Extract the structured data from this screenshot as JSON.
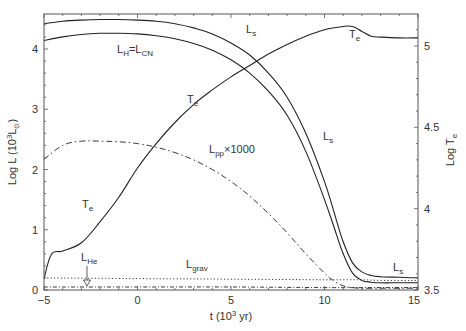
{
  "chart_data": {
    "type": "line",
    "title": "",
    "xlabel": "t (10^3 yr)",
    "ylabel_left": "Log L (10^3 L☉)",
    "ylabel_right": "Log T_e",
    "xlim": [
      -5,
      15
    ],
    "ylim_left": [
      0,
      4.6
    ],
    "ylim_right": [
      3.5,
      5.2
    ],
    "x_ticks": [
      -5,
      0,
      5,
      10,
      15
    ],
    "y_ticks_left": [
      0,
      1,
      2,
      3,
      4
    ],
    "y_ticks_right": [
      3.5,
      4,
      4.5,
      5
    ],
    "grid": false,
    "legend": "inline labels",
    "series": [
      {
        "name": "L_s",
        "axis": "left",
        "style": "solid",
        "x": [
          -5,
          -4,
          -3,
          -2,
          -1,
          0,
          1,
          2,
          3,
          4,
          5,
          6,
          7,
          8,
          9,
          10,
          10.5,
          11,
          11.5,
          12,
          12.5,
          13,
          14,
          15
        ],
        "y": [
          4.42,
          4.46,
          4.48,
          4.49,
          4.49,
          4.48,
          4.46,
          4.42,
          4.35,
          4.25,
          4.1,
          3.9,
          3.6,
          3.2,
          2.6,
          1.8,
          1.3,
          0.8,
          0.45,
          0.3,
          0.24,
          0.22,
          0.21,
          0.2
        ]
      },
      {
        "name": "L_H = L_CN",
        "axis": "left",
        "style": "solid",
        "x": [
          -5,
          -4,
          -3,
          -2,
          -1,
          0,
          1,
          2,
          3,
          4,
          5,
          6,
          7,
          8,
          9,
          10,
          10.5,
          11,
          11.5,
          12,
          12.5,
          13,
          14,
          15
        ],
        "y": [
          4.14,
          4.2,
          4.24,
          4.26,
          4.26,
          4.25,
          4.22,
          4.17,
          4.09,
          3.98,
          3.82,
          3.6,
          3.3,
          2.9,
          2.3,
          1.5,
          1.05,
          0.6,
          0.28,
          0.16,
          0.13,
          0.12,
          0.12,
          0.12
        ]
      },
      {
        "name": "T_e",
        "axis": "right",
        "style": "solid",
        "x": [
          -5,
          -4.6,
          -4,
          -3,
          -2,
          -1,
          0,
          1,
          2,
          3,
          4,
          5,
          6,
          7,
          8,
          9,
          10,
          11,
          11.5,
          12,
          12.5,
          13,
          14,
          15
        ],
        "y": [
          3.57,
          3.72,
          3.74,
          3.79,
          3.92,
          4.07,
          4.25,
          4.4,
          4.53,
          4.64,
          4.73,
          4.81,
          4.88,
          4.95,
          5.01,
          5.06,
          5.1,
          5.12,
          5.12,
          5.09,
          5.06,
          5.055,
          5.05,
          5.05
        ]
      },
      {
        "name": "L_pp × 1000",
        "axis": "left",
        "style": "dashdot",
        "x": [
          -5,
          -4,
          -3,
          -2,
          -1,
          0,
          1,
          2,
          3,
          4,
          5,
          6,
          7,
          8,
          9,
          10,
          10.5,
          11,
          11.5,
          12,
          13,
          14,
          15
        ],
        "y": [
          2.17,
          2.4,
          2.47,
          2.47,
          2.46,
          2.43,
          2.37,
          2.28,
          2.16,
          2.0,
          1.8,
          1.56,
          1.27,
          0.95,
          0.6,
          0.28,
          0.15,
          0.07,
          0.04,
          0.03,
          0.03,
          0.03,
          0.03
        ]
      },
      {
        "name": "L_grav",
        "axis": "left",
        "style": "dotted",
        "x": [
          -5,
          0,
          5,
          10,
          12,
          13,
          15
        ],
        "y": [
          0.2,
          0.19,
          0.18,
          0.17,
          0.17,
          0.16,
          0.16
        ]
      },
      {
        "name": "L_He",
        "axis": "left",
        "style": "dashdot-dense",
        "x": [
          -5,
          0,
          5,
          10,
          12,
          15
        ],
        "y": [
          0.05,
          0.05,
          0.05,
          0.04,
          0.04,
          0.04
        ]
      }
    ],
    "annotations": [
      {
        "text": "L_s",
        "x": 5.5,
        "y": 4.42
      },
      {
        "text": "L_H=L_CN",
        "x": -1.8,
        "y": 3.95
      },
      {
        "text": "T_e",
        "x": 0.8,
        "y": 3.2
      },
      {
        "text": "T_e",
        "x": 11.3,
        "y": 4.4
      },
      {
        "text": "T_e",
        "x": -4.1,
        "y": 1.8
      },
      {
        "text": "L_pp×1000",
        "x": 2.8,
        "y": 2.6
      },
      {
        "text": "L_s",
        "x": 9.1,
        "y": 3.2
      },
      {
        "text": "L_s",
        "x": 13.6,
        "y": 0.8
      },
      {
        "text": "L_He",
        "x": -2.8,
        "y": 0.5
      },
      {
        "text": "L_grav",
        "x": 2.6,
        "y": 0.32
      }
    ]
  },
  "labels": {
    "x_ticks": [
      "−5",
      "0",
      "5",
      "10",
      "15"
    ],
    "y_left_ticks": [
      "0",
      "1",
      "2",
      "3",
      "4"
    ],
    "y_right_ticks": [
      "3.5",
      "4",
      "4.5",
      "5"
    ],
    "xlabel_main": "t (10",
    "xlabel_sup": "3",
    "xlabel_tail": " yr)",
    "ylabel_left_main": "Log L (10",
    "ylabel_left_sup": "3",
    "ylabel_left_sub": "L",
    "ylabel_left_sym": "⊙",
    "ylabel_left_tail": ")",
    "ylabel_right_main": "Log T",
    "ylabel_right_sub": "e",
    "ann_ls": "L",
    "ann_ls_sub": "s",
    "ann_lh": "L",
    "ann_lh_sub": "H",
    "ann_lh_eq": "=L",
    "ann_lh_sub2": "CN",
    "ann_te": "T",
    "ann_te_sub": "e",
    "ann_lpp": "L",
    "ann_lpp_sub": "pp",
    "ann_lpp_tail": "×1000",
    "ann_lhe": "L",
    "ann_lhe_sub": "He",
    "ann_lgrav": "L",
    "ann_lgrav_sub": "grav"
  }
}
